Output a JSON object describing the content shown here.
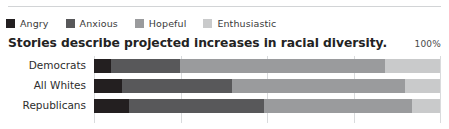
{
  "legend": {
    "items": [
      {
        "label": "Angry",
        "color": "#231f20"
      },
      {
        "label": "Anxious",
        "color": "#58585a"
      },
      {
        "label": "Hopeful",
        "color": "#9a9b9d"
      },
      {
        "label": "Enthusiastic",
        "color": "#c9cacb"
      }
    ]
  },
  "title": "Stories describe projected increases in racial diversity.",
  "axis_max_label": "100%",
  "chart_data": {
    "type": "bar",
    "orientation": "horizontal",
    "stacked": true,
    "stack_total": 100,
    "title": "Stories describe projected increases in racial diversity.",
    "xlabel": "",
    "ylabel": "",
    "xlim": [
      0,
      100
    ],
    "xticks": [
      0,
      25,
      50,
      75,
      100
    ],
    "xtick_labels": [
      "",
      "",
      "",
      "",
      "100%"
    ],
    "grid": true,
    "legend_position": "top-left",
    "categories": [
      "Democrats",
      "All Whites",
      "Republicans"
    ],
    "series": [
      {
        "name": "Angry",
        "color": "#231f20",
        "values": [
          5,
          8,
          10
        ]
      },
      {
        "name": "Anxious",
        "color": "#58585a",
        "values": [
          20,
          32,
          39
        ]
      },
      {
        "name": "Hopeful",
        "color": "#9a9b9d",
        "values": [
          59,
          50,
          43
        ]
      },
      {
        "name": "Enthusiastic",
        "color": "#c9cacb",
        "values": [
          16,
          10,
          8
        ]
      }
    ],
    "rows": [
      {
        "category": "Democrats",
        "segments": [
          5,
          20,
          59,
          16
        ]
      },
      {
        "category": "All Whites",
        "segments": [
          8,
          32,
          50,
          10
        ]
      },
      {
        "category": "Republicans",
        "segments": [
          10,
          39,
          43,
          8
        ]
      }
    ]
  },
  "colors": {
    "grid": "#d9dbdd",
    "rule": "#d2d4d6",
    "text": "#2d2d2d",
    "background": "#ffffff"
  }
}
